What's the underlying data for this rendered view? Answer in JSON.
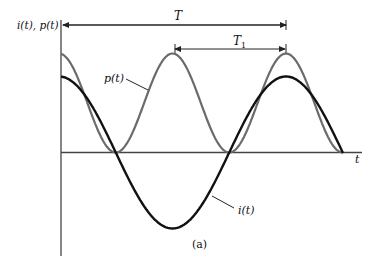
{
  "figure": {
    "y_axis_label": "i(t), p(t)",
    "x_axis_label": "t",
    "period_label": "T",
    "period1_label": "T",
    "period1_subscript": "1",
    "p_curve_label": "p(t)",
    "i_curve_label": "i(t)",
    "caption": "(a)",
    "colors": {
      "axis": "#444444",
      "p_curve": "#6b6b6b",
      "i_curve": "#111111"
    }
  }
}
